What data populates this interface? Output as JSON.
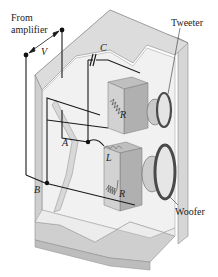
{
  "diagram": {
    "labels": {
      "source_line1": "From",
      "source_line2": "amplifier",
      "voltage": "V",
      "capacitor": "C",
      "tweeter": "Tweeter",
      "tweeter_resistance": "R",
      "node_a": "A",
      "inductor": "L",
      "woofer_resistance": "R",
      "node_b": "B",
      "woofer": "Woofer"
    },
    "components": [
      {
        "id": "C",
        "type": "capacitor",
        "in_series_with": "tweeter"
      },
      {
        "id": "L",
        "type": "inductor",
        "in_series_with": "woofer"
      },
      {
        "id": "R_tweeter",
        "type": "resistor",
        "label": "R"
      },
      {
        "id": "R_woofer",
        "type": "resistor",
        "label": "R"
      }
    ],
    "nodes": [
      "A",
      "B"
    ],
    "colors": {
      "cabinet_face": "#d9d9d9",
      "cabinet_light": "#efefef",
      "cabinet_dark": "#bdbdbd",
      "wire": "#1a1a1a",
      "box": "#cfcfcf",
      "speaker_rim": "#5a5a5a"
    }
  }
}
